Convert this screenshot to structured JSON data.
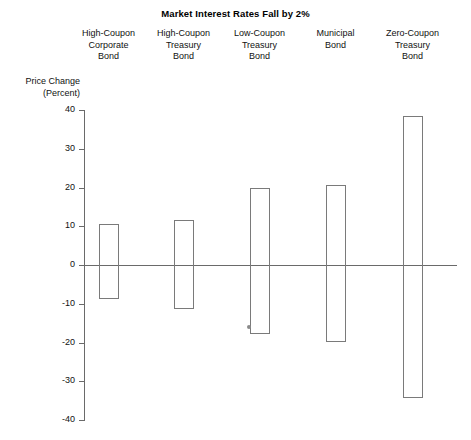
{
  "chart_data": {
    "type": "bar",
    "title": "Market Interest Rates Fall by 2%",
    "xlabel": "",
    "ylabel": "Price Change\n(Percent)",
    "ylim": [
      -40,
      40
    ],
    "yticks": [
      40,
      30,
      20,
      10,
      0,
      -10,
      -20,
      -30,
      -40
    ],
    "ytick_labels": [
      "40",
      "30",
      "20",
      "10",
      "0",
      "-10",
      "-20",
      "-30",
      "-40"
    ],
    "grid": false,
    "legend": "none",
    "note": "Each vertical bar is a floating range showing the price gain when rates fall 2% (top) and the price loss when rates rise 2% (bottom).",
    "categories": [
      "High-Coupon\nCorporate\nBond",
      "High-Coupon\nTreasury\nBond",
      "Low-Coupon\nTreasury\nBond",
      "Municipal\nBond",
      "Zero-Coupon\nTreasury\nBond"
    ],
    "series": [
      {
        "name": "Price gain (rates fall 2%)",
        "values": [
          10.5,
          11.5,
          19.8,
          20.7,
          38.5
        ]
      },
      {
        "name": "Price loss (rates rise 2%)",
        "values": [
          -8.8,
          -11.3,
          -17.7,
          -19.8,
          -34.3
        ]
      }
    ],
    "bars": [
      {
        "category": "High-Coupon Corporate Bond",
        "top": 10.5,
        "bottom": -8.8
      },
      {
        "category": "High-Coupon Treasury Bond",
        "top": 11.5,
        "bottom": -11.3
      },
      {
        "category": "Low-Coupon Treasury Bond",
        "top": 19.8,
        "bottom": -17.7
      },
      {
        "category": "Municipal Bond",
        "top": 20.7,
        "bottom": -19.8
      },
      {
        "category": "Zero-Coupon Treasury Bond",
        "top": 38.5,
        "bottom": -34.3
      }
    ],
    "colors": {
      "bar_outline": "#7a7a7a",
      "axis": "#6a6a6a",
      "text": "#111111",
      "background": "#ffffff"
    }
  }
}
